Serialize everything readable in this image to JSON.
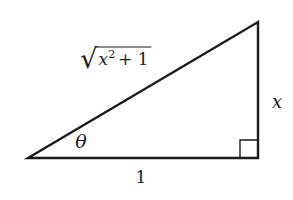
{
  "labels": {
    "hypotenuse": {
      "radical": "√",
      "variable": "x",
      "exponent": "2",
      "plus_term": "+ 1"
    },
    "opposite_side": "x",
    "adjacent_side": "1",
    "angle": "θ"
  },
  "colors": {
    "line": "#1a1a1a",
    "background": "#ffffff"
  }
}
